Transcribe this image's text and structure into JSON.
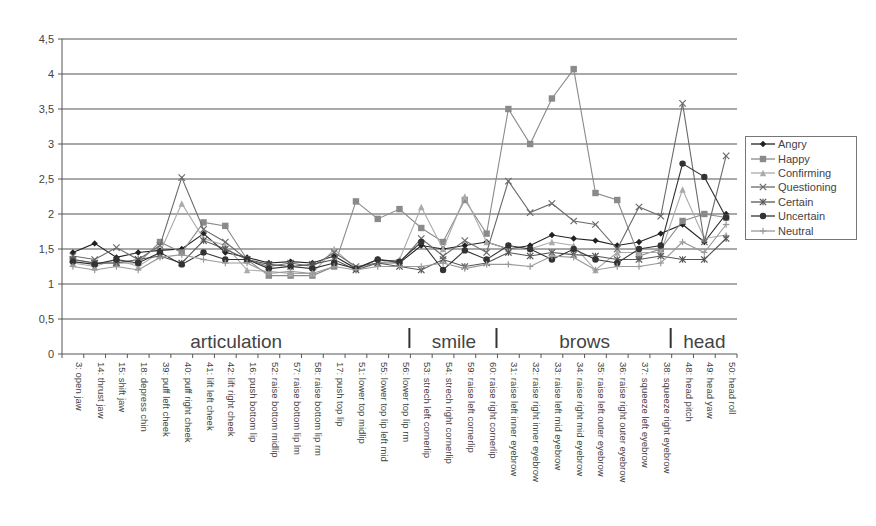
{
  "chart_data": {
    "type": "line",
    "title": "",
    "xlabel": "",
    "ylabel": "",
    "ylim": [
      0,
      4.5
    ],
    "yticks": [
      "0",
      "0,5",
      "1",
      "1,5",
      "2",
      "2,5",
      "3",
      "3,5",
      "4",
      "4,5"
    ],
    "grid": true,
    "legend_position": "right",
    "categories": [
      "3: open jaw",
      "14: thrust jaw",
      "15: shift jaw",
      "18: depress chin",
      "39: puff left cheek",
      "40: puff right cheek",
      "41: lift left cheek",
      "42: lift right cheek",
      "16: push bottom lip",
      "52: raise bottom midlip",
      "57: raise bottom lip lm",
      "58: raise bottom lip rm",
      "17: push top lip",
      "51: lower top midlip",
      "55: lower top lip left mid",
      "56: lower top lip rm",
      "53: strech left cornerlip",
      "54: strech right cornerlip",
      "59: raise left cornerlip",
      "60: raise right cornerlip",
      "31: raise left inner eyebrow",
      "32: raise right inner eyebrow",
      "33: raise left mid eyebrow",
      "34: raise right mid eyebrow",
      "35: raise left outer eyebrow",
      "36: raise right outer eyebrow",
      "37: squeeze left eyebrow",
      "38: squeeze right eyebrow",
      "48: head pitch",
      "49: head yaw",
      "50: head roll"
    ],
    "groups": [
      {
        "label": "articulation",
        "start": 0,
        "end": 15
      },
      {
        "label": "smile",
        "start": 16,
        "end": 19
      },
      {
        "label": "brows",
        "start": 20,
        "end": 27
      },
      {
        "label": "head",
        "start": 28,
        "end": 30
      }
    ],
    "series": [
      {
        "name": "Angry",
        "marker": "diamond",
        "color": "#222222",
        "values": [
          1.45,
          1.58,
          1.38,
          1.45,
          1.48,
          1.5,
          1.72,
          1.45,
          1.38,
          1.3,
          1.32,
          1.3,
          1.4,
          1.22,
          1.35,
          1.3,
          1.55,
          1.5,
          1.55,
          1.6,
          1.5,
          1.55,
          1.7,
          1.65,
          1.62,
          1.55,
          1.6,
          1.72,
          1.85,
          1.6,
          2.0
        ]
      },
      {
        "name": "Happy",
        "marker": "square",
        "color": "#8a8a8a",
        "values": [
          1.35,
          1.3,
          1.3,
          1.3,
          1.6,
          1.45,
          1.88,
          1.83,
          1.35,
          1.12,
          1.12,
          1.12,
          1.25,
          2.18,
          1.93,
          2.07,
          1.8,
          1.6,
          2.2,
          1.72,
          3.5,
          3.0,
          3.65,
          4.07,
          2.3,
          2.2,
          1.4,
          1.5,
          1.9,
          2.0,
          1.95
        ]
      },
      {
        "name": "Confirming",
        "marker": "triangle",
        "color": "#aaaaaa",
        "values": [
          1.3,
          1.25,
          1.35,
          1.25,
          1.45,
          2.15,
          1.65,
          1.55,
          1.2,
          1.18,
          1.15,
          1.15,
          1.5,
          1.22,
          1.3,
          1.35,
          2.1,
          1.5,
          2.25,
          1.6,
          1.5,
          1.5,
          1.6,
          1.55,
          1.2,
          1.45,
          1.45,
          1.45,
          2.35,
          1.65,
          1.7
        ]
      },
      {
        "name": "Questioning",
        "marker": "x",
        "color": "#6a6a6a",
        "values": [
          1.4,
          1.35,
          1.52,
          1.35,
          1.55,
          2.52,
          1.78,
          1.6,
          1.35,
          1.25,
          1.3,
          1.25,
          1.45,
          1.25,
          1.3,
          1.3,
          1.65,
          1.4,
          1.62,
          1.45,
          2.47,
          2.02,
          2.15,
          1.9,
          1.85,
          1.5,
          2.1,
          1.97,
          3.58,
          1.6,
          2.83
        ]
      },
      {
        "name": "Certain",
        "marker": "star",
        "color": "#555555",
        "values": [
          1.35,
          1.3,
          1.3,
          1.35,
          1.4,
          1.3,
          1.62,
          1.5,
          1.35,
          1.28,
          1.25,
          1.28,
          1.35,
          1.2,
          1.3,
          1.25,
          1.2,
          1.35,
          1.25,
          1.3,
          1.45,
          1.4,
          1.45,
          1.42,
          1.4,
          1.35,
          1.35,
          1.4,
          1.35,
          1.35,
          1.65
        ]
      },
      {
        "name": "Uncertain",
        "marker": "circle",
        "color": "#333333",
        "values": [
          1.32,
          1.28,
          1.35,
          1.3,
          1.45,
          1.28,
          1.45,
          1.35,
          1.35,
          1.22,
          1.25,
          1.22,
          1.3,
          1.22,
          1.35,
          1.32,
          1.6,
          1.2,
          1.48,
          1.35,
          1.55,
          1.5,
          1.35,
          1.5,
          1.35,
          1.3,
          1.5,
          1.55,
          2.72,
          2.53,
          1.95
        ]
      },
      {
        "name": "Neutral",
        "marker": "plus",
        "color": "#999999",
        "values": [
          1.25,
          1.2,
          1.25,
          1.2,
          1.38,
          1.42,
          1.35,
          1.3,
          1.3,
          1.15,
          1.18,
          1.15,
          1.25,
          1.2,
          1.25,
          1.25,
          1.25,
          1.3,
          1.22,
          1.28,
          1.28,
          1.25,
          1.4,
          1.38,
          1.2,
          1.25,
          1.25,
          1.3,
          1.6,
          1.45,
          1.85
        ]
      }
    ]
  }
}
